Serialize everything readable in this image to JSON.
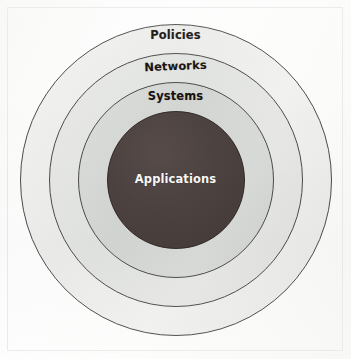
{
  "figure": {
    "type": "concentric-rings-diagram",
    "background_color": "#fdfdfd",
    "frame_color": "#e9eae9",
    "center": {
      "x": 176,
      "y": 180
    },
    "layers": [
      {
        "key": "policies",
        "label": "Policies",
        "order": 1,
        "position": "outermost",
        "radius": 156,
        "fill_color": "#eeeeee",
        "stroke_color": "#4b4b4b",
        "text_color": "#17120f"
      },
      {
        "key": "networks",
        "label": "Networks",
        "order": 2,
        "position": "second",
        "radius": 127,
        "fill_color": "#e4e5e3",
        "stroke_color": "#4b4b4b",
        "text_color": "#17120f"
      },
      {
        "key": "systems",
        "label": "Systems",
        "order": 3,
        "position": "third",
        "radius": 98,
        "fill_color": "#d6d8d6",
        "stroke_color": "#4b4b4b",
        "text_color": "#17120f"
      },
      {
        "key": "applications",
        "label": "Applications",
        "order": 4,
        "position": "innermost",
        "radius": 69,
        "fill_color": "#4a403e",
        "stroke_color": "#2f2826",
        "text_color": "#fafafa"
      }
    ]
  }
}
